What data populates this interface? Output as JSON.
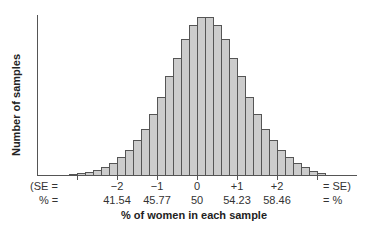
{
  "chart_data": {
    "type": "bar",
    "title": "",
    "xlabel": "% of women in each sample",
    "ylabel": "Number of samples",
    "grid": false,
    "legend": null,
    "se_row_label_left": "(SE =",
    "se_row_label_right": "= SE)",
    "pct_row_label_left": "% =",
    "pct_row_label_right": "= %",
    "ticks": [
      {
        "se": "−2",
        "pct": "41.54"
      },
      {
        "se": "−1",
        "pct": "45.77"
      },
      {
        "se": "0",
        "pct": "50"
      },
      {
        "se": "+1",
        "pct": "54.23"
      },
      {
        "se": "+2",
        "pct": "58.46"
      }
    ],
    "bar_count": 32,
    "values": [
      1,
      2,
      3,
      5,
      8,
      12,
      18,
      25,
      35,
      46,
      61,
      78,
      99,
      117,
      136,
      150,
      158,
      158,
      150,
      136,
      117,
      99,
      78,
      61,
      46,
      35,
      25,
      18,
      12,
      8,
      4,
      2
    ],
    "bar_fill": "#cccccc",
    "bar_stroke": "#555555",
    "axis_color": "#555555"
  },
  "labels": {
    "ylabel": "Number of samples",
    "xlabel": "% of women in each sample",
    "se_left": "(SE =",
    "se_right": "= SE)",
    "pct_left": "% =",
    "pct_right": "= %",
    "se_ticks": [
      "−2",
      "−1",
      "0",
      "+1",
      "+2"
    ],
    "pct_ticks": [
      "41.54",
      "45.77",
      "50",
      "54.23",
      "58.46"
    ]
  }
}
